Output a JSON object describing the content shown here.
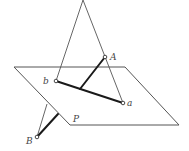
{
  "diagram": {
    "type": "projection-geometry",
    "plane": {
      "label": "P"
    },
    "points": {
      "A": {
        "label": "A"
      },
      "a": {
        "label": "a"
      },
      "b": {
        "label": "b"
      },
      "B": {
        "label": "B"
      }
    },
    "colors": {
      "thin_line": "#555555",
      "thick_line": "#1a1a1a",
      "label": "#444444"
    }
  }
}
